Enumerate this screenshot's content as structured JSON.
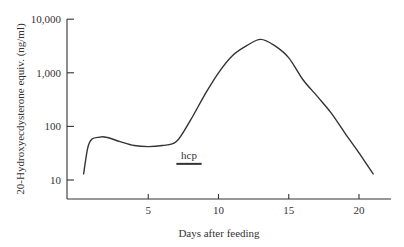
{
  "chart_data": {
    "type": "line",
    "title": "",
    "xlabel": "Days after feeding",
    "ylabel": "20-Hydroxyecdysterone equiv. (ng/ml)",
    "yscale": "log",
    "ylim": [
      10,
      10000
    ],
    "xlim": [
      0,
      22
    ],
    "grid": false,
    "x_ticks": [
      5,
      10,
      15,
      20
    ],
    "x_tick_labels": [
      "5",
      "10",
      "15",
      "20"
    ],
    "y_ticks": [
      10,
      100,
      1000,
      10000
    ],
    "y_tick_labels": [
      "10",
      "100",
      "1,000",
      "10,000"
    ],
    "series": [
      {
        "name": "20-Hydroxyecdysterone",
        "x": [
          0.4,
          0.7,
          1.0,
          1.5,
          2.0,
          3.0,
          4.0,
          5.0,
          6.0,
          7.0,
          8.0,
          9.0,
          10.0,
          11.0,
          12.0,
          13.0,
          14.0,
          15.0,
          16.0,
          17.0,
          18.0,
          19.0,
          20.0,
          21.0
        ],
        "values": [
          13,
          40,
          58,
          63,
          63,
          52,
          44,
          42,
          44,
          52,
          130,
          380,
          1000,
          2100,
          3200,
          4200,
          3200,
          1900,
          750,
          370,
          180,
          75,
          32,
          13
        ]
      }
    ],
    "annotations": [
      {
        "text": "hcp",
        "type": "bar",
        "x_start": 7.0,
        "x_end": 8.8,
        "y": 20
      }
    ]
  }
}
